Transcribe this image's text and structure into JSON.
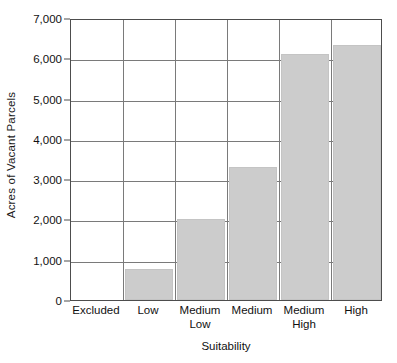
{
  "chart_data": {
    "type": "bar",
    "title": "",
    "xlabel": "Suitability",
    "ylabel": "Acres of Vacant Parcels",
    "categories": [
      "Excluded",
      "Low",
      "Medium Low",
      "Medium",
      "Medium High",
      "High"
    ],
    "category_lines": [
      [
        "Excluded"
      ],
      [
        "Low"
      ],
      [
        "Medium",
        "Low"
      ],
      [
        "Medium"
      ],
      [
        "Medium",
        "High"
      ],
      [
        "High"
      ]
    ],
    "values": [
      0,
      780,
      2000,
      3300,
      6100,
      6320
    ],
    "ylim": [
      0,
      7000
    ],
    "ytick_values": [
      0,
      1000,
      2000,
      3000,
      4000,
      5000,
      6000,
      7000
    ],
    "ytick_labels": [
      "0",
      "1,000",
      "2,000",
      "3,000",
      "4,000",
      "5,000",
      "6,000",
      "7,000"
    ],
    "grid": true,
    "grid_axis": "y",
    "legend": false,
    "bar_color": "#cccccc",
    "bar_edge_color": "#c4c4c4",
    "grid_color": "#7a7a7a",
    "axis_color": "#4d4d4d",
    "text_color": "#111111",
    "background_color": "#ffffff"
  }
}
